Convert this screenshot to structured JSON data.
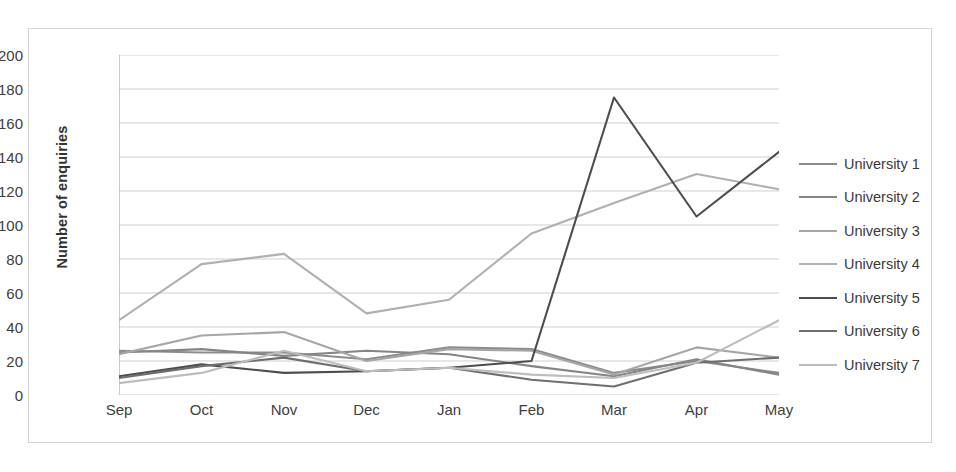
{
  "chart_data": {
    "type": "line",
    "title": "",
    "xlabel": "",
    "ylabel": "Number of enquiries",
    "categories": [
      "Sep",
      "Oct",
      "Nov",
      "Dec",
      "Jan",
      "Feb",
      "Mar",
      "Apr",
      "May"
    ],
    "ylim": [
      0,
      200
    ],
    "ytick_step": 20,
    "yticks": [
      0,
      20,
      40,
      60,
      80,
      100,
      120,
      140,
      160,
      180,
      200
    ],
    "grid": "horizontal",
    "legend_position": "right",
    "series": [
      {
        "name": "University 1",
        "color": "#8c8c8c",
        "values": [
          26,
          25,
          25,
          21,
          28,
          27,
          13,
          20,
          13
        ]
      },
      {
        "name": "University 2",
        "color": "#858585",
        "values": [
          25,
          27,
          23,
          26,
          24,
          17,
          11,
          21,
          12
        ]
      },
      {
        "name": "University 3",
        "color": "#a6a6a6",
        "values": [
          24,
          35,
          37,
          20,
          27,
          26,
          12,
          28,
          22
        ]
      },
      {
        "name": "University 4",
        "color": "#b0b0b0",
        "values": [
          44,
          77,
          83,
          48,
          56,
          95,
          113,
          130,
          121
        ]
      },
      {
        "name": "University 5",
        "color": "#4d4d4d",
        "values": [
          11,
          18,
          13,
          14,
          16,
          20,
          175,
          105,
          143
        ]
      },
      {
        "name": "University 6",
        "color": "#6e6e6e",
        "values": [
          10,
          17,
          22,
          14,
          16,
          9,
          5,
          19,
          22
        ]
      },
      {
        "name": "University 7",
        "color": "#bdbdbd",
        "values": [
          7,
          13,
          26,
          14,
          16,
          12,
          10,
          19,
          44
        ]
      }
    ]
  },
  "axis": {
    "y_title": "Number of enquiries"
  },
  "legend": {
    "items": [
      {
        "label": "University 1"
      },
      {
        "label": "University 2"
      },
      {
        "label": "University 3"
      },
      {
        "label": "University 4"
      },
      {
        "label": "University 5"
      },
      {
        "label": "University 6"
      },
      {
        "label": "University 7"
      }
    ]
  },
  "colors": {
    "frame_border": "#d4d4d4",
    "gridline": "#c9c9c9",
    "axis_line": "#a8a8a8",
    "tick_text": "#404040",
    "background": "#ffffff"
  }
}
